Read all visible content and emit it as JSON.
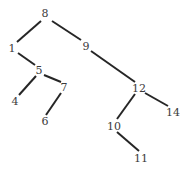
{
  "figure": {
    "title": "",
    "width": 191,
    "height": 171,
    "background_color": "#ffffff"
  },
  "chart_data": {
    "type": "diagram",
    "diagram_kind": "node-link-tree",
    "title": "",
    "xlabel": "",
    "ylabel": "",
    "grid": false,
    "legend": null,
    "axis_visible": false,
    "node_color": "#3b3b3b",
    "edge_color": "#262626",
    "edge_width": 2,
    "label_font_size": 11,
    "nodes": [
      {
        "id": "8",
        "label": "8",
        "x": 45,
        "y": 13
      },
      {
        "id": "1",
        "label": "1",
        "x": 12,
        "y": 48
      },
      {
        "id": "9",
        "label": "9",
        "x": 86,
        "y": 46
      },
      {
        "id": "5",
        "label": "5",
        "x": 39,
        "y": 70
      },
      {
        "id": "7",
        "label": "7",
        "x": 64,
        "y": 87
      },
      {
        "id": "12",
        "label": "12",
        "x": 139,
        "y": 88
      },
      {
        "id": "4",
        "label": "4",
        "x": 15,
        "y": 101
      },
      {
        "id": "14",
        "label": "14",
        "x": 173,
        "y": 112
      },
      {
        "id": "6",
        "label": "6",
        "x": 45,
        "y": 121
      },
      {
        "id": "10",
        "label": "10",
        "x": 114,
        "y": 126
      },
      {
        "id": "11",
        "label": "11",
        "x": 141,
        "y": 158
      }
    ],
    "edges": [
      {
        "source": "8",
        "target": "1",
        "x1": 41,
        "y1": 21,
        "x2": 17,
        "y2": 42
      },
      {
        "source": "8",
        "target": "9",
        "x1": 52,
        "y1": 21,
        "x2": 81,
        "y2": 40
      },
      {
        "source": "1",
        "target": "5",
        "x1": 18,
        "y1": 53,
        "x2": 35,
        "y2": 65
      },
      {
        "source": "5",
        "target": "4",
        "x1": 36,
        "y1": 76,
        "x2": 19,
        "y2": 95
      },
      {
        "source": "5",
        "target": "7",
        "x1": 44,
        "y1": 75,
        "x2": 61,
        "y2": 82
      },
      {
        "source": "7",
        "target": "6",
        "x1": 61,
        "y1": 93,
        "x2": 46,
        "y2": 115
      },
      {
        "source": "9",
        "target": "12",
        "x1": 91,
        "y1": 51,
        "x2": 135,
        "y2": 82
      },
      {
        "source": "12",
        "target": "10",
        "x1": 135,
        "y1": 94,
        "x2": 117,
        "y2": 119
      },
      {
        "source": "12",
        "target": "14",
        "x1": 145,
        "y1": 93,
        "x2": 168,
        "y2": 106
      },
      {
        "source": "10",
        "target": "11",
        "x1": 117,
        "y1": 132,
        "x2": 139,
        "y2": 151
      }
    ]
  }
}
